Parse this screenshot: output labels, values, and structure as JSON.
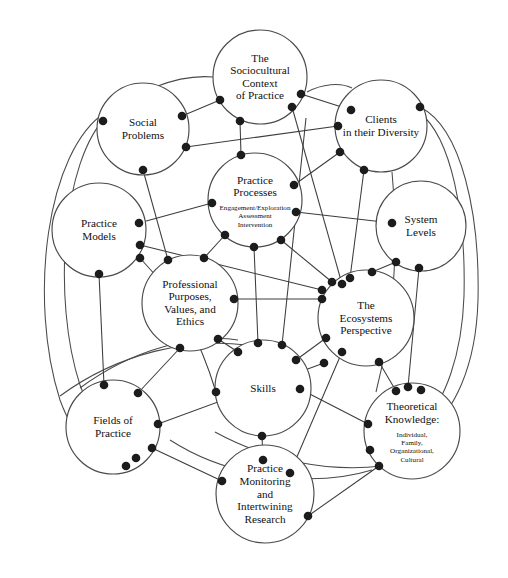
{
  "diagram": {
    "type": "concept-network",
    "background_color": "#ffffff",
    "stroke_color": "#4a4a4a",
    "node_fill": "#ffffff",
    "dot_color": "#1c1c1c",
    "width": 508,
    "height": 578,
    "nodes": [
      {
        "id": "sociocultural",
        "label_lines": [
          "The",
          "Sociocultural",
          "Context",
          "of Practice"
        ],
        "sub_lines": [],
        "cx": 260,
        "cy": 77,
        "r": 47,
        "label_size": "normal"
      },
      {
        "id": "social-problems",
        "label_lines": [
          "Social",
          "Problems"
        ],
        "sub_lines": [],
        "cx": 143,
        "cy": 129,
        "r": 46,
        "label_size": "normal"
      },
      {
        "id": "clients",
        "label_lines": [
          "Clients",
          "in their Diversity"
        ],
        "sub_lines": [],
        "cx": 381,
        "cy": 126,
        "r": 46,
        "label_size": "normal"
      },
      {
        "id": "practice-processes",
        "label_lines": [
          "Practice",
          "Processes"
        ],
        "sub_lines": [
          "Engagement/Exploration",
          "Assessment",
          "Intervention"
        ],
        "cx": 255,
        "cy": 200,
        "r": 47,
        "label_size": "normal"
      },
      {
        "id": "practice-models",
        "label_lines": [
          "Practice",
          "Models"
        ],
        "sub_lines": [],
        "cx": 99,
        "cy": 230,
        "r": 47,
        "label_size": "normal"
      },
      {
        "id": "system-levels",
        "label_lines": [
          "System",
          "Levels"
        ],
        "sub_lines": [],
        "cx": 421,
        "cy": 226,
        "r": 45,
        "label_size": "normal"
      },
      {
        "id": "professional-purposes",
        "label_lines": [
          "Professional",
          "Purposes,",
          "Values, and",
          "Ethics"
        ],
        "sub_lines": [],
        "cx": 190,
        "cy": 303,
        "r": 48,
        "label_size": "normal"
      },
      {
        "id": "ecosystems",
        "label_lines": [
          "The",
          "Ecosystems",
          "Perspective"
        ],
        "sub_lines": [],
        "cx": 366,
        "cy": 318,
        "r": 48,
        "label_size": "normal"
      },
      {
        "id": "skills",
        "label_lines": [
          "Skills"
        ],
        "sub_lines": [],
        "cx": 263,
        "cy": 388,
        "r": 48,
        "label_size": "normal"
      },
      {
        "id": "theoretical-knowledge",
        "label_lines": [
          "Theoretical",
          "Knowledge:"
        ],
        "sub_lines": [
          "Individual,",
          "Family,",
          "Organizational,",
          "Cultural"
        ],
        "cx": 412,
        "cy": 431,
        "r": 48,
        "label_size": "normal"
      },
      {
        "id": "fields-of-practice",
        "label_lines": [
          "Fields of",
          "Practice"
        ],
        "sub_lines": [],
        "cx": 113,
        "cy": 427,
        "r": 47,
        "label_size": "normal"
      },
      {
        "id": "practice-monitoring",
        "label_lines": [
          "Practice",
          "Monitoring",
          "and",
          "Intertwining",
          "Research"
        ],
        "sub_lines": [],
        "cx": 265,
        "cy": 494,
        "r": 49,
        "label_size": "normal"
      }
    ],
    "edge_count": 30,
    "connector_dot_count": 60
  }
}
